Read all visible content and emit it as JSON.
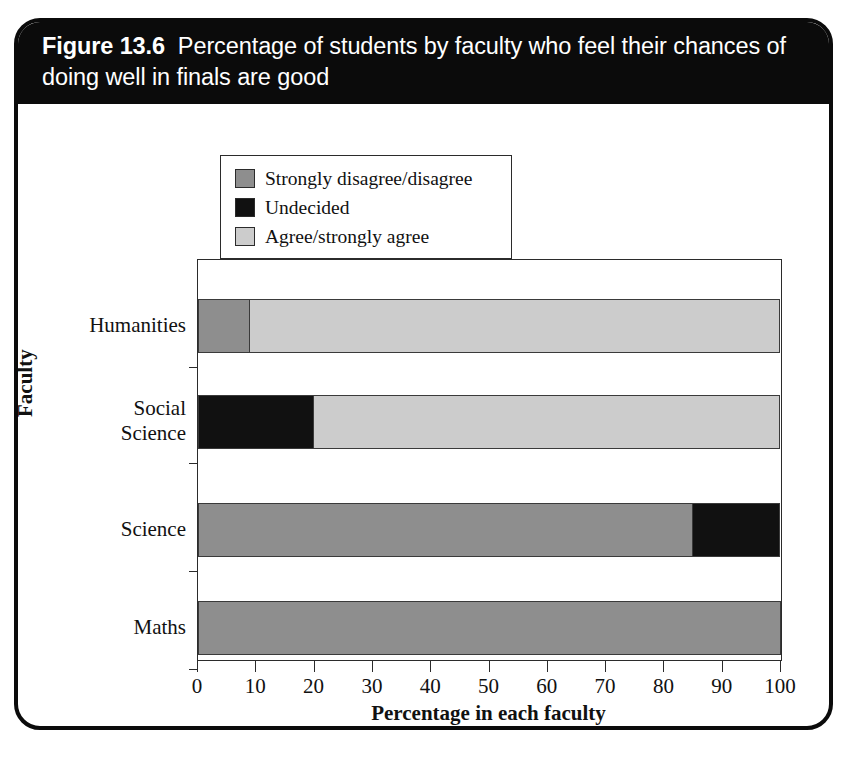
{
  "figure": {
    "label": "Figure 13.6",
    "caption": "Percentage of students by faculty who feel their chances of doing well in finals are good"
  },
  "chart_data": {
    "type": "bar",
    "orientation": "horizontal",
    "stacked": true,
    "stack_mode": "percent",
    "xlabel": "Percentage in each faculty",
    "ylabel": "Faculty",
    "xlim": [
      0,
      100
    ],
    "xticks": [
      0,
      10,
      20,
      30,
      40,
      50,
      60,
      70,
      80,
      90,
      100
    ],
    "xtick_labels": [
      "0",
      "10",
      "20",
      "30",
      "40",
      "50",
      "60",
      "70",
      "80",
      "90",
      "100"
    ],
    "grid": false,
    "legend_position": "above-plot-left",
    "categories": [
      "Humanities",
      "Social Science",
      "Science",
      "Maths"
    ],
    "category_display": [
      "Humanities",
      "Social\nScience",
      "Science",
      "Maths"
    ],
    "series": [
      {
        "name": "Strongly disagree/disagree",
        "color": "#8e8e8e",
        "values": [
          9,
          0,
          85,
          100
        ]
      },
      {
        "name": "Undecided",
        "color": "#111111",
        "values": [
          0,
          20,
          15,
          0
        ]
      },
      {
        "name": "Agree/strongly agree",
        "color": "#cccccc",
        "values": [
          91,
          80,
          0,
          0
        ]
      }
    ]
  },
  "legend": {
    "items": [
      {
        "label": "Strongly disagree/disagree",
        "color": "#8e8e8e"
      },
      {
        "label": "Undecided",
        "color": "#111111"
      },
      {
        "label": "Agree/strongly agree",
        "color": "#cccccc"
      }
    ]
  },
  "colors": {
    "frame": "#0b0b0b",
    "caption_background": "#0b0b0b",
    "caption_text": "#ffffff",
    "axis": "#2b2b2b",
    "disagree": "#8e8e8e",
    "undecided": "#111111",
    "agree": "#cccccc",
    "page_background": "#ffffff"
  }
}
